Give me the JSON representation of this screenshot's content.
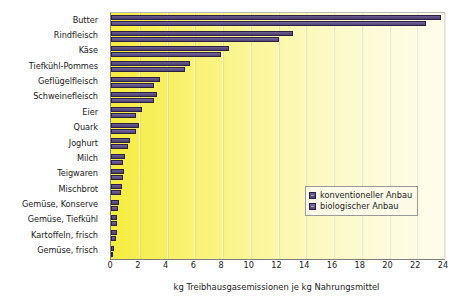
{
  "chart_data": {
    "type": "bar",
    "orientation": "horizontal",
    "title": "",
    "xlabel": "kg Treibhausgasemissionen je kg Nahrungsmittel",
    "ylabel": "",
    "xlim": [
      0,
      24
    ],
    "xticks": [
      0,
      2,
      4,
      6,
      8,
      10,
      12,
      14,
      16,
      18,
      20,
      22,
      24
    ],
    "grid": true,
    "legend_position": "bottom-right",
    "categories": [
      "Butter",
      "Rindfleisch",
      "Käse",
      "Tiefkühl-Pommes",
      "Geflügelfleisch",
      "Schweinefleisch",
      "Eier",
      "Quark",
      "Joghurt",
      "Milch",
      "Teigwaren",
      "Mischbrot",
      "Gemüse, Konserve",
      "Gemüse, Tiefkühl",
      "Kartoffeln, frisch",
      "Gemüse, frisch"
    ],
    "series": [
      {
        "name": "konventioneller Anbau",
        "color": "#5b4e80",
        "values": [
          23.8,
          13.1,
          8.5,
          5.7,
          3.5,
          3.3,
          2.2,
          2.0,
          1.4,
          1.0,
          0.95,
          0.8,
          0.55,
          0.45,
          0.4,
          0.2
        ]
      },
      {
        "name": "biologischer Anbau",
        "color": "#62558c",
        "values": [
          22.7,
          12.1,
          7.9,
          5.3,
          3.1,
          3.1,
          1.8,
          1.8,
          1.2,
          0.9,
          0.9,
          0.75,
          0.5,
          0.4,
          0.35,
          0.15
        ]
      }
    ]
  },
  "legend": {
    "items": [
      {
        "label": "konventioneller Anbau"
      },
      {
        "label": "biologischer Anbau"
      }
    ]
  }
}
